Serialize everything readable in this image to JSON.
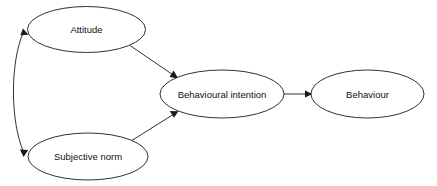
{
  "diagram": {
    "background_color": "#ffffff",
    "stroke_color": "#1a1a1a",
    "text_color": "#111111",
    "width": 437,
    "height": 186,
    "nodes": [
      {
        "id": "attitude",
        "label": "Attitude",
        "shape": "ellipse",
        "cx": 86.5,
        "cy": 29.5,
        "rx": 59,
        "ry": 23
      },
      {
        "id": "subjective-norm",
        "label": "Subjective norm",
        "shape": "ellipse",
        "cx": 88,
        "cy": 156.5,
        "rx": 60,
        "ry": 23.5
      },
      {
        "id": "behavioural-intention",
        "label": "Behavioural intention",
        "shape": "ellipse",
        "cx": 222,
        "cy": 94,
        "rx": 62,
        "ry": 24
      },
      {
        "id": "behaviour",
        "label": "Behaviour",
        "shape": "ellipse",
        "cx": 367.5,
        "cy": 94,
        "rx": 56.5,
        "ry": 24
      }
    ],
    "edges": [
      {
        "id": "attitude-to-intention",
        "from": "attitude",
        "to": "behavioural-intention",
        "style": "straight",
        "arrowheads": "single",
        "label": ""
      },
      {
        "id": "subjective-norm-to-intention",
        "from": "subjective-norm",
        "to": "behavioural-intention",
        "style": "straight",
        "arrowheads": "single",
        "label": ""
      },
      {
        "id": "intention-to-behaviour",
        "from": "behavioural-intention",
        "to": "behaviour",
        "style": "straight",
        "arrowheads": "single",
        "label": ""
      },
      {
        "id": "attitude-subjective-norm-correlation",
        "from": "attitude",
        "to": "subjective-norm",
        "style": "curved",
        "arrowheads": "double",
        "label": ""
      }
    ]
  }
}
